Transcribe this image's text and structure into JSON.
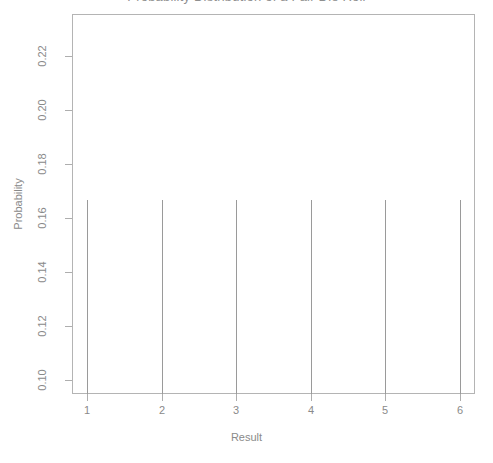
{
  "chart_data": {
    "type": "bar",
    "subtype": "spike-plot",
    "title": "Probability Distribution of a Fair Die Roll",
    "xlabel": "Result",
    "ylabel": "Probability",
    "categories": [
      "1",
      "2",
      "3",
      "4",
      "5",
      "6"
    ],
    "x": [
      1,
      2,
      3,
      4,
      5,
      6
    ],
    "values": [
      0.1667,
      0.1667,
      0.1667,
      0.1667,
      0.1667,
      0.1667
    ],
    "xlim": [
      0.8,
      6.2
    ],
    "ylim": [
      0.095,
      0.2355
    ],
    "xticks": [
      1,
      2,
      3,
      4,
      5,
      6
    ],
    "xtick_labels": [
      "1",
      "2",
      "3",
      "4",
      "5",
      "6"
    ],
    "yticks": [
      0.1,
      0.12,
      0.14,
      0.16,
      0.18,
      0.2,
      0.22
    ],
    "ytick_labels": [
      "0.10",
      "0.12",
      "0.14",
      "0.16",
      "0.18",
      "0.20",
      "0.22"
    ],
    "grid": false,
    "legend": false,
    "legend_position": "none",
    "series_color": "#9a9a9a",
    "box_color": "#b4b4b4",
    "background": "#ffffff",
    "text_color": "#8a8a8a"
  }
}
